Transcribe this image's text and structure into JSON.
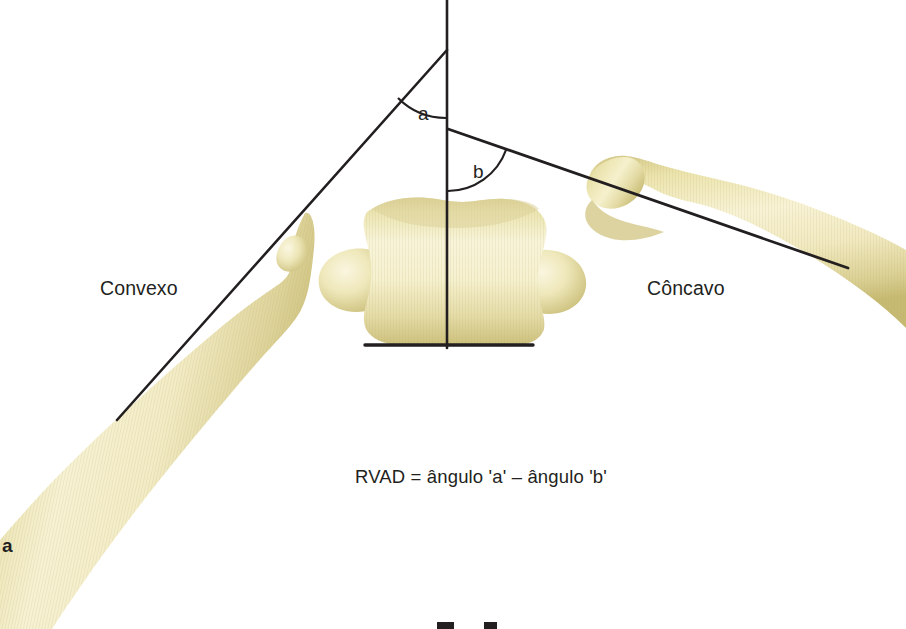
{
  "figure": {
    "letter": "a",
    "formula": "RVAD = ângulo 'a' – ângulo 'b'",
    "background_color": "#ffffff",
    "line_color": "#231f20",
    "bone_fill_light": "#f7f2d2",
    "bone_fill_mid": "#ebe3ae",
    "bone_fill_dark": "#cdc17c"
  },
  "labels": {
    "convex_side": "Convexo",
    "concave_side": "Côncavo",
    "angle_a": "a",
    "angle_b": "b"
  },
  "geometry": {
    "vertical_reference_line": {
      "x": 447,
      "y_top": 0,
      "y_bottom": 348
    },
    "vertebra_baseline": {
      "x_start": 365,
      "x_end": 533,
      "y": 345
    },
    "convex_rib_axis": {
      "x1": 447,
      "y1": 50,
      "x2": 117,
      "y2": 420
    },
    "concave_rib_axis": {
      "x1": 448,
      "y1": 129,
      "x2": 848,
      "y2": 268
    },
    "angle_a": {
      "vertex_x": 447,
      "vertex_y": 50,
      "arc_radius": 68
    },
    "angle_b": {
      "vertex_x": 448,
      "vertex_y": 129,
      "arc_radius": 62
    }
  }
}
